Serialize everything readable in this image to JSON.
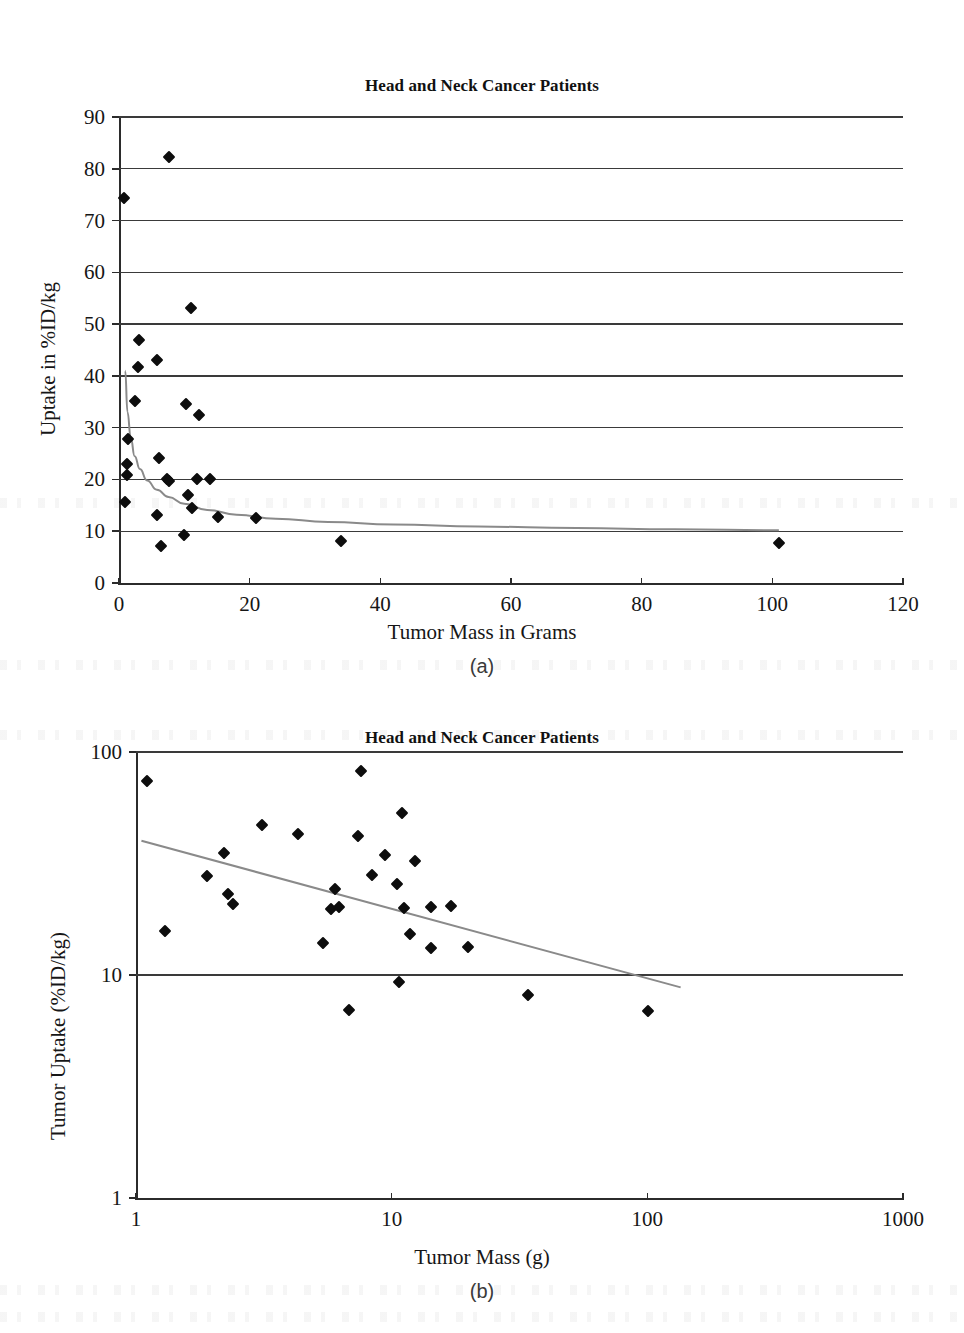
{
  "page": {
    "width": 964,
    "height": 1333,
    "background": "#ffffff",
    "ink_color": "#1a1a1a",
    "trendline_color": "#8a8a8a",
    "gridline_color": "#3a3a3a",
    "marker_color": "#0d0d0d"
  },
  "panels": [
    {
      "id": "panel-a",
      "caption": "(a)",
      "title": "Head and Neck Cancer Patients"
    },
    {
      "id": "panel-b",
      "caption": "(b)",
      "title": "Head and Neck Cancer Patients"
    }
  ],
  "chart_data": [
    {
      "id": "panel-a",
      "type": "scatter",
      "title": "Head and Neck Cancer Patients",
      "subplot_label": "(a)",
      "xlabel": "Tumor Mass in Grams",
      "ylabel": "Uptake in %ID/kg",
      "xscale": "linear",
      "yscale": "linear",
      "xlim": [
        0,
        120
      ],
      "ylim": [
        0,
        90
      ],
      "xticks": [
        0,
        20,
        40,
        60,
        80,
        100,
        120
      ],
      "yticks": [
        0,
        10,
        20,
        30,
        40,
        50,
        60,
        70,
        80,
        90
      ],
      "xticklabels": [
        "0",
        "20",
        "40",
        "60",
        "80",
        "100",
        "120"
      ],
      "yticklabels": [
        "0",
        "10",
        "20",
        "30",
        "40",
        "50",
        "60",
        "70",
        "80",
        "90"
      ],
      "grid": "horizontal",
      "legend": "none",
      "series": [
        {
          "name": "Tumor uptake vs mass",
          "marker": "diamond",
          "points": [
            [
              0.7,
              74.4
            ],
            [
              7.6,
              82.2
            ],
            [
              11.0,
              53.1
            ],
            [
              3.1,
              46.9
            ],
            [
              2.9,
              41.8
            ],
            [
              5.8,
              43.0
            ],
            [
              2.4,
              35.1
            ],
            [
              10.3,
              34.6
            ],
            [
              12.3,
              32.4
            ],
            [
              1.4,
              27.9
            ],
            [
              6.1,
              24.2
            ],
            [
              1.3,
              22.9
            ],
            [
              1.3,
              20.9
            ],
            [
              7.4,
              20.0
            ],
            [
              7.6,
              19.7
            ],
            [
              12.0,
              20.1
            ],
            [
              14.0,
              20.0
            ],
            [
              0.9,
              15.7
            ],
            [
              10.5,
              17.0
            ],
            [
              5.8,
              13.2
            ],
            [
              11.1,
              14.4
            ],
            [
              15.2,
              12.8
            ],
            [
              21.0,
              12.6
            ],
            [
              9.9,
              9.3
            ],
            [
              34.0,
              8.2
            ],
            [
              6.5,
              7.1
            ],
            [
              101.0,
              7.7
            ]
          ]
        }
      ],
      "trendline": {
        "type": "power",
        "description": "decaying power-law fit from about 41 %ID/kg near 1 g to about 10 %ID/kg near 100 g",
        "points": [
          [
            0.95,
            41.0
          ],
          [
            1.3,
            33.0
          ],
          [
            1.8,
            28.0
          ],
          [
            2.4,
            24.5
          ],
          [
            3.2,
            22.0
          ],
          [
            4.3,
            19.8
          ],
          [
            5.8,
            18.0
          ],
          [
            7.6,
            16.6
          ],
          [
            10.0,
            15.3
          ],
          [
            13.5,
            14.1
          ],
          [
            18.0,
            13.2
          ],
          [
            24.0,
            12.4
          ],
          [
            32.0,
            11.8
          ],
          [
            42.0,
            11.3
          ],
          [
            55.0,
            10.9
          ],
          [
            70.0,
            10.6
          ],
          [
            85.0,
            10.4
          ],
          [
            101.0,
            10.2
          ]
        ]
      }
    },
    {
      "id": "panel-b",
      "type": "scatter",
      "title": "Head and Neck Cancer Patients",
      "subplot_label": "(b)",
      "xlabel": "Tumor Mass (g)",
      "ylabel": "Tumor Uptake (%ID/kg)",
      "xscale": "log",
      "yscale": "log",
      "xlim": [
        1,
        1000
      ],
      "ylim": [
        1,
        100
      ],
      "xticks": [
        1,
        10,
        100,
        1000
      ],
      "yticks": [
        1,
        10,
        100
      ],
      "xticklabels": [
        "1",
        "10",
        "100",
        "1000"
      ],
      "yticklabels": [
        "1",
        "10",
        "100"
      ],
      "grid": "horizontal",
      "legend": "none",
      "series": [
        {
          "name": "Tumor uptake vs mass (log-log)",
          "marker": "diamond",
          "points": [
            [
              1.1,
              74.4
            ],
            [
              7.6,
              82.2
            ],
            [
              11.0,
              53.1
            ],
            [
              3.1,
              46.9
            ],
            [
              4.3,
              43.0
            ],
            [
              7.4,
              41.8
            ],
            [
              2.2,
              35.1
            ],
            [
              9.4,
              34.6
            ],
            [
              12.3,
              32.4
            ],
            [
              8.4,
              28.0
            ],
            [
              10.5,
              25.6
            ],
            [
              1.9,
              27.9
            ],
            [
              2.3,
              23.1
            ],
            [
              2.4,
              20.9
            ],
            [
              6.0,
              24.2
            ],
            [
              5.8,
              19.8
            ],
            [
              6.2,
              20.1
            ],
            [
              11.2,
              20.0
            ],
            [
              14.3,
              20.1
            ],
            [
              17.1,
              20.4
            ],
            [
              1.3,
              15.7
            ],
            [
              11.8,
              15.2
            ],
            [
              5.4,
              13.9
            ],
            [
              14.3,
              13.2
            ],
            [
              19.8,
              13.3
            ],
            [
              10.7,
              9.3
            ],
            [
              6.8,
              7.0
            ],
            [
              34.0,
              8.1
            ],
            [
              101.0,
              6.9
            ]
          ]
        }
      ],
      "trendline": {
        "type": "linear-on-log-log",
        "description": "straight fit line descending from about 40 %ID/kg at 1.05 g to about 8.8 %ID/kg at 135 g",
        "points": [
          [
            1.05,
            40.0
          ],
          [
            135.0,
            8.8
          ]
        ]
      }
    }
  ]
}
